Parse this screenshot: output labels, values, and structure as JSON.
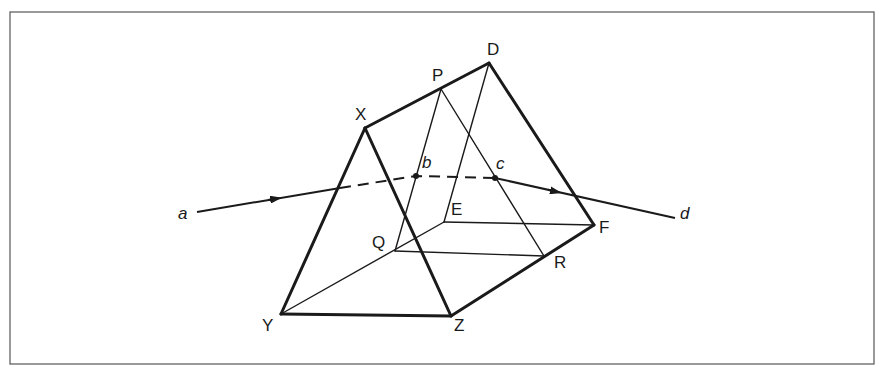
{
  "diagram": {
    "vertices": {
      "X": "X",
      "D": "D",
      "P": "P",
      "Y": "Y",
      "Z": "Z",
      "E": "E",
      "F": "F",
      "Q": "Q",
      "R": "R"
    },
    "ray_points": {
      "a": "a",
      "b": "b",
      "c": "c",
      "d": "d"
    },
    "colors": {
      "line": "#1a1a1a",
      "frame": "#555555",
      "background": "#ffffff"
    }
  }
}
